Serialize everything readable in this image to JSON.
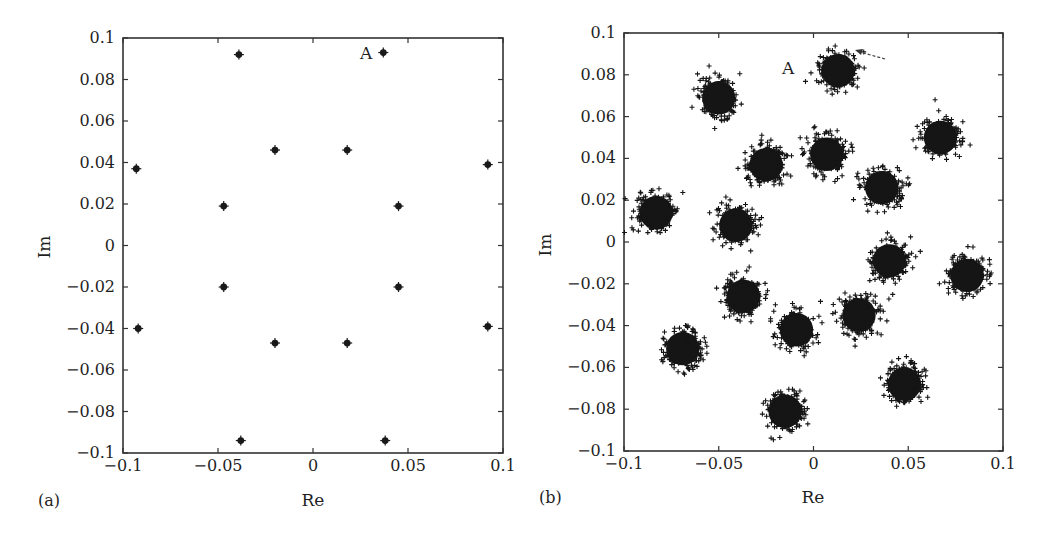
{
  "figure": {
    "panels": [
      {
        "panel_label": "(a)",
        "xlabel": "Re",
        "ylabel": "Im",
        "annotation": "A",
        "xticks": [
          "−0.1",
          "−0.05",
          "0",
          "0.05",
          "0.1"
        ],
        "yticks": [
          "0.1",
          "0.08",
          "0.06",
          "0.04",
          "0.02",
          "0",
          "−0.02",
          "−0.04",
          "−0.06",
          "−0.08",
          "−0.1"
        ]
      },
      {
        "panel_label": "(b)",
        "xlabel": "Re",
        "ylabel": "Im",
        "annotation": "A",
        "xticks": [
          "−0.1",
          "−0.05",
          "0",
          "0.05",
          "0.1"
        ],
        "yticks": [
          "0.1",
          "0.08",
          "0.06",
          "0.04",
          "0.02",
          "0",
          "−0.02",
          "−0.04",
          "−0.06",
          "−0.08",
          "−0.1"
        ]
      }
    ],
    "colors": {
      "ink": "#1a1a1a",
      "background": "#ffffff",
      "axis": "#333333"
    }
  },
  "chart_data": [
    {
      "type": "scatter",
      "title": "(a)",
      "xlabel": "Re",
      "ylabel": "Im",
      "xlim": [
        -0.1,
        0.1
      ],
      "ylim": [
        -0.1,
        0.1
      ],
      "xticks": [
        -0.1,
        -0.05,
        0,
        0.05,
        0.1
      ],
      "yticks": [
        -0.1,
        -0.08,
        -0.06,
        -0.04,
        -0.02,
        0,
        0.02,
        0.04,
        0.06,
        0.08,
        0.1
      ],
      "grid": false,
      "legend": null,
      "annotations": [
        {
          "text": "A",
          "x": 0.037,
          "y": 0.093,
          "position": "left of point"
        }
      ],
      "series": [
        {
          "name": "constellation points (noise-free)",
          "marker": "filled dot",
          "points": [
            [
              -0.039,
              0.092
            ],
            [
              0.037,
              0.093
            ],
            [
              -0.093,
              0.037
            ],
            [
              0.092,
              0.039
            ],
            [
              -0.02,
              0.046
            ],
            [
              0.018,
              0.046
            ],
            [
              -0.047,
              0.019
            ],
            [
              0.045,
              0.019
            ],
            [
              -0.047,
              -0.02
            ],
            [
              0.045,
              -0.02
            ],
            [
              -0.092,
              -0.04
            ],
            [
              0.092,
              -0.039
            ],
            [
              -0.02,
              -0.047
            ],
            [
              0.018,
              -0.047
            ],
            [
              -0.038,
              -0.094
            ],
            [
              0.038,
              -0.094
            ]
          ]
        }
      ]
    },
    {
      "type": "scatter",
      "title": "(b)",
      "xlabel": "Re",
      "ylabel": "Im",
      "xlim": [
        -0.1,
        0.1
      ],
      "ylim": [
        -0.1,
        0.1
      ],
      "xticks": [
        -0.1,
        -0.05,
        0,
        0.05,
        0.1
      ],
      "yticks": [
        -0.1,
        -0.08,
        -0.06,
        -0.04,
        -0.02,
        0,
        0.02,
        0.04,
        0.06,
        0.08,
        0.1
      ],
      "grid": false,
      "legend": null,
      "annotations": [
        {
          "text": "A",
          "x": -0.01,
          "y": 0.083,
          "arrow_to_cluster": [
            0.013,
            0.082
          ]
        }
      ],
      "series": [
        {
          "name": "noisy constellation clusters (centers)",
          "marker": "+ (dense clusters)",
          "cluster_radius_approx": 0.011,
          "points": [
            [
              0.013,
              0.082
            ],
            [
              -0.05,
              0.069
            ],
            [
              0.067,
              0.05
            ],
            [
              -0.025,
              0.037
            ],
            [
              0.007,
              0.042
            ],
            [
              0.036,
              0.026
            ],
            [
              -0.083,
              0.014
            ],
            [
              -0.041,
              0.008
            ],
            [
              0.04,
              -0.009
            ],
            [
              0.081,
              -0.016
            ],
            [
              -0.037,
              -0.026
            ],
            [
              0.024,
              -0.035
            ],
            [
              -0.009,
              -0.042
            ],
            [
              -0.069,
              -0.051
            ],
            [
              0.048,
              -0.068
            ],
            [
              -0.015,
              -0.081
            ]
          ]
        }
      ]
    }
  ]
}
